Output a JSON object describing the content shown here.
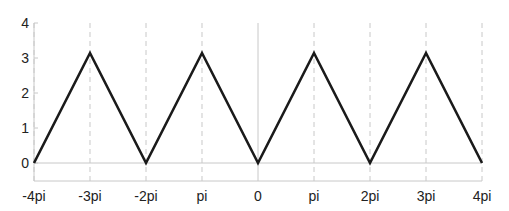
{
  "chart_data": {
    "type": "line",
    "title": "",
    "xlabel": "",
    "ylabel": "",
    "x_ticks": [
      "-4pi",
      "-3pi",
      "-2pi",
      "pi",
      "0",
      "pi",
      "2pi",
      "3pi",
      "4pi"
    ],
    "x_tick_values": [
      -12.566,
      -9.425,
      -6.283,
      -3.1416,
      0,
      3.1416,
      6.283,
      9.425,
      12.566
    ],
    "y_ticks": [
      "0",
      "1",
      "2",
      "3",
      "4"
    ],
    "xlim": [
      -12.566,
      12.566
    ],
    "ylim": [
      -0.5,
      4
    ],
    "grid": {
      "x": "dashed vertical at ticks (solid at 0)",
      "y": "horizontal at y=0"
    },
    "legend": null,
    "series": [
      {
        "name": "triangle wave",
        "color": "#1a1a1a",
        "x": [
          -12.566,
          -9.425,
          -6.283,
          -3.1416,
          0,
          3.1416,
          6.283,
          9.425,
          12.566
        ],
        "y": [
          0,
          3.1416,
          0,
          3.1416,
          0,
          3.1416,
          0,
          3.1416,
          0
        ]
      }
    ]
  },
  "colors": {
    "line": "#1a1a1a",
    "grid": "#c8c8c8",
    "axis": "#c8c8c8",
    "text": "#222222"
  }
}
